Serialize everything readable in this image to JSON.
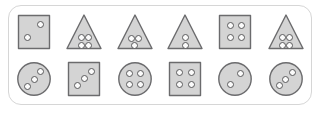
{
  "panel": {
    "name": "shape-pattern-panel",
    "border_color": "#d6d6d6",
    "background_color": "#ffffff",
    "corner_radius": "13px"
  },
  "style": {
    "shape_fill": "#d4d4d4",
    "shape_stroke": "#6b6b6d",
    "pip_fill": "#fbfbfb",
    "pip_stroke": "#59595b"
  },
  "rows": [
    {
      "name": "top-row",
      "cells": [
        {
          "index": 1,
          "shape": "square",
          "dot_count": 2,
          "dot_layout": "diagonal",
          "dots": [
            [
              0.66,
              0.33
            ],
            [
              0.34,
              0.62
            ]
          ]
        },
        {
          "index": 2,
          "shape": "triangle",
          "dot_count": 4,
          "dot_layout": "grid-2x2",
          "dots": [
            [
              0.42,
              0.64
            ],
            [
              0.6,
              0.64
            ],
            [
              0.42,
              0.81
            ],
            [
              0.6,
              0.81
            ]
          ]
        },
        {
          "index": 3,
          "shape": "triangle",
          "dot_count": 3,
          "dot_layout": "two-over-one",
          "dots": [
            [
              0.42,
              0.65
            ],
            [
              0.59,
              0.65
            ],
            [
              0.5,
              0.82
            ]
          ]
        },
        {
          "index": 4,
          "shape": "triangle",
          "dot_count": 2,
          "dot_layout": "vertical",
          "dots": [
            [
              0.5,
              0.64
            ],
            [
              0.5,
              0.81
            ]
          ]
        },
        {
          "index": 5,
          "shape": "square",
          "dot_count": 4,
          "dot_layout": "grid-2x2",
          "dots": [
            [
              0.37,
              0.35
            ],
            [
              0.64,
              0.35
            ],
            [
              0.37,
              0.64
            ],
            [
              0.64,
              0.64
            ]
          ]
        },
        {
          "index": 6,
          "shape": "triangle",
          "dot_count": 4,
          "dot_layout": "grid-2x2",
          "dots": [
            [
              0.42,
              0.64
            ],
            [
              0.6,
              0.64
            ],
            [
              0.42,
              0.81
            ],
            [
              0.6,
              0.81
            ]
          ]
        }
      ]
    },
    {
      "name": "bottom-row",
      "cells": [
        {
          "index": 1,
          "shape": "circle",
          "dot_count": 3,
          "dot_layout": "diagonal",
          "dots": [
            [
              0.66,
              0.33
            ],
            [
              0.5,
              0.5
            ],
            [
              0.34,
              0.67
            ]
          ]
        },
        {
          "index": 2,
          "shape": "square",
          "dot_count": 3,
          "dot_layout": "diagonal",
          "dots": [
            [
              0.67,
              0.32
            ],
            [
              0.51,
              0.49
            ],
            [
              0.34,
              0.66
            ]
          ]
        },
        {
          "index": 3,
          "shape": "circle",
          "dot_count": 4,
          "dot_layout": "grid-2x2",
          "dots": [
            [
              0.37,
              0.36
            ],
            [
              0.64,
              0.36
            ],
            [
              0.37,
              0.64
            ],
            [
              0.64,
              0.64
            ]
          ]
        },
        {
          "index": 4,
          "shape": "square",
          "dot_count": 4,
          "dot_layout": "grid-2x2",
          "dots": [
            [
              0.37,
              0.35
            ],
            [
              0.64,
              0.35
            ],
            [
              0.37,
              0.64
            ],
            [
              0.64,
              0.64
            ]
          ]
        },
        {
          "index": 5,
          "shape": "circle",
          "dot_count": 2,
          "dot_layout": "diagonal",
          "dots": [
            [
              0.62,
              0.36
            ],
            [
              0.38,
              0.63
            ]
          ]
        },
        {
          "index": 6,
          "shape": "circle",
          "dot_count": 3,
          "dot_layout": "diagonal",
          "dots": [
            [
              0.66,
              0.34
            ],
            [
              0.5,
              0.5
            ],
            [
              0.34,
              0.66
            ]
          ]
        }
      ]
    }
  ]
}
